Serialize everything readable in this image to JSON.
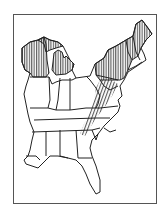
{
  "map": {
    "title": "",
    "region": "Eastern United States",
    "legend": [],
    "colors": {
      "frame": "#555555",
      "outline": "#222222",
      "hatch": "#333333",
      "background": "#ffffff"
    },
    "hatched_regions": [
      "Wisconsin (northern)",
      "Michigan",
      "Pennsylvania",
      "New York",
      "Vermont",
      "New Hampshire",
      "Maine",
      "Appalachian band (WV, VA, TN, NC border)"
    ]
  }
}
